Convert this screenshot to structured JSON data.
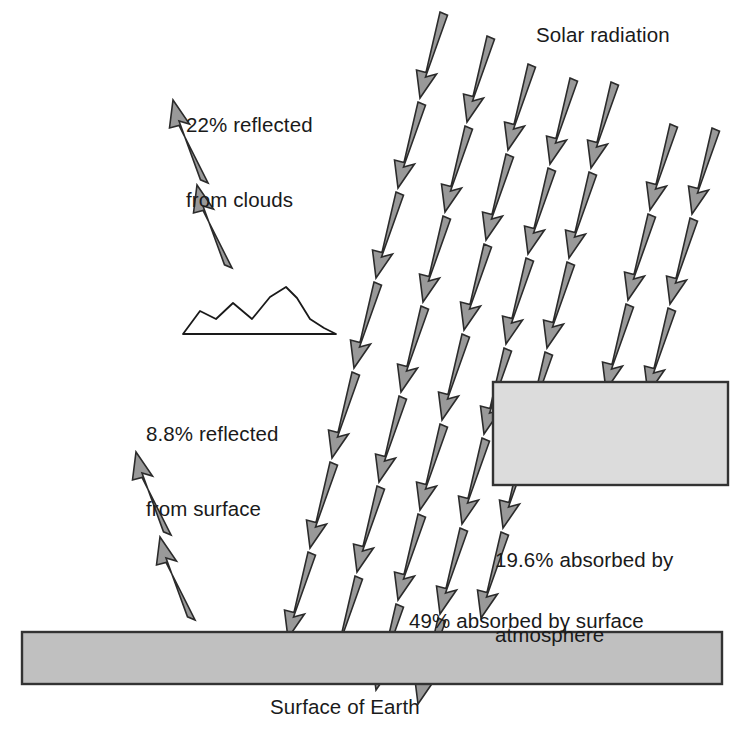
{
  "diagram": {
    "title_label": "Solar radiation",
    "caption": "Surface of Earth",
    "labels": {
      "reflected_clouds_line1": "22% reflected",
      "reflected_clouds_line2": "from clouds",
      "reflected_surface_line1": "8.8% reflected",
      "reflected_surface_line2": "from surface",
      "absorbed_atmosphere_line1": "19.6% absorbed by",
      "absorbed_atmosphere_line2": "atmosphere",
      "absorbed_surface": "49% absorbed by surface"
    },
    "icon_names": {
      "incoming_ray": "down-arrow-icon",
      "cloud_reflection_ray": "up-arrow-icon",
      "surface_reflection_ray": "up-arrow-icon",
      "cloud": "cloud-icon",
      "earth_bar": "earth-surface-icon",
      "atmosphere_box": "atmosphere-layer-icon"
    },
    "colors": {
      "arrow_fill": "#999999",
      "arrow_stroke": "#2b2b2b",
      "earth_fill": "#c0c0c0",
      "atmosphere_fill": "#dcdcdc",
      "box_stroke": "#333333",
      "text": "#1a1a1a",
      "background": "#ffffff"
    },
    "energy_budget": {
      "reflected_from_clouds_pct": 22,
      "reflected_from_surface_pct": 8.8,
      "absorbed_by_atmosphere_pct": 19.6,
      "absorbed_by_surface_pct": 49
    },
    "geometry": {
      "earth_bar": {
        "x": 22,
        "y": 632,
        "width": 700,
        "height": 52
      },
      "atmosphere_box": {
        "x": 493,
        "y": 382,
        "width": 235,
        "height": 103
      },
      "incoming_rays": [
        {
          "x": 440,
          "y": 12,
          "segments": 7,
          "name": "incoming-ray-1"
        },
        {
          "x": 483,
          "y": 36,
          "segments": 7,
          "name": "incoming-ray-2"
        },
        {
          "x": 512,
          "y": 64,
          "segments": 6,
          "name": "incoming-ray-3"
        },
        {
          "x": 549,
          "y": 74,
          "segments": 6,
          "name": "incoming-ray-4"
        },
        {
          "x": 578,
          "y": 76,
          "segments": 5,
          "name": "incoming-ray-5"
        },
        {
          "x": 628,
          "y": 118,
          "segments": 4,
          "name": "incoming-ray-6"
        },
        {
          "x": 670,
          "y": 124,
          "segments": 4,
          "name": "incoming-ray-7"
        }
      ],
      "cloud_reflection_ray": {
        "x": 232,
        "y": 268,
        "segments": 2
      },
      "surface_reflection_ray": {
        "x": 192,
        "y": 618,
        "segments": 2
      },
      "cloud_points": "185,332 200,310 215,318 232,302 250,318 268,298 283,288 295,298 308,318 322,327 332,332"
    }
  }
}
